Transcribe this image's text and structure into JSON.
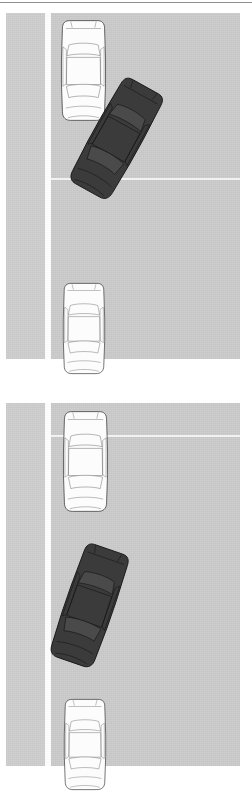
{
  "figure": {
    "width": 252,
    "height": 778,
    "background_color": "#ffffff",
    "top_rule_color": "#8f8f8f"
  },
  "palette": {
    "page_background": "#ffffff",
    "road_gray": "#cccccc",
    "shoulder_gray": "#cfcfcf",
    "lane_line_white": "#fbfbfb",
    "lane_line_faint": "#f2f2f2",
    "dark_car_body": "#3b3b3b",
    "dark_car_outline": "#141414",
    "dark_car_glass": "#4a4a4a",
    "light_car_body": "#fcfcfc",
    "light_car_outline": "#2b2b2b",
    "light_car_detail": "#6f6f6f"
  },
  "panels": [
    {
      "id": "panel-top",
      "label": "Top panel — dark car angled across the lane line",
      "rect": {
        "x": 0,
        "y": 13,
        "width": 240,
        "height": 346
      },
      "road": {
        "shoulder": {
          "x": 6,
          "y": 0,
          "width": 39,
          "height": 346
        },
        "lane_line_vertical": {
          "x": 45,
          "y": 0,
          "width": 6,
          "height": 346
        },
        "surface": {
          "x": 51,
          "y": 0,
          "width": 189,
          "height": 346
        },
        "lane_line_horizontal": {
          "x": 51,
          "y": 165,
          "width": 189,
          "height": 2
        }
      },
      "cars": [
        {
          "id": "top-light-car-upper",
          "name": "light-car-upper",
          "color": "light",
          "x": 59,
          "y": 5,
          "width": 49,
          "height": 105,
          "rotation_deg": 0,
          "description": "White sedan, overhead view, heading up the lane"
        },
        {
          "id": "top-dark-car",
          "name": "dark-car-merging",
          "color": "dark",
          "x": 90,
          "y": 63,
          "width": 53,
          "height": 125,
          "rotation_deg": 29,
          "description": "Dark sedan angled roughly 29 degrees, crossing into the lane"
        },
        {
          "id": "top-light-car-lower",
          "name": "light-car-lower",
          "color": "light",
          "x": 61,
          "y": 268,
          "width": 46,
          "height": 95,
          "rotation_deg": 0,
          "description": "White sedan partially cropped at the panel bottom"
        }
      ]
    },
    {
      "id": "panel-bottom",
      "label": "Bottom panel — dark car further along, more aligned with the lane",
      "rect": {
        "x": 0,
        "y": 403,
        "width": 240,
        "height": 363
      },
      "road": {
        "shoulder": {
          "x": 6,
          "y": 0,
          "width": 39,
          "height": 363
        },
        "lane_line_vertical": {
          "x": 45,
          "y": 0,
          "width": 6,
          "height": 363
        },
        "surface": {
          "x": 51,
          "y": 0,
          "width": 189,
          "height": 363
        },
        "lane_line_horizontal": {
          "x": 51,
          "y": 32,
          "width": 189,
          "height": 2
        }
      },
      "cars": [
        {
          "id": "bottom-light-car-upper",
          "name": "light-car-upper",
          "color": "light",
          "x": 61,
          "y": 6,
          "width": 49,
          "height": 105,
          "rotation_deg": 0,
          "description": "White sedan ahead in the lane"
        },
        {
          "id": "bottom-dark-car",
          "name": "dark-car-merging",
          "color": "dark",
          "x": 63,
          "y": 140,
          "width": 53,
          "height": 125,
          "rotation_deg": 19,
          "description": "Dark sedan angled roughly 19 degrees, settling into the lane"
        },
        {
          "id": "bottom-light-car-lower",
          "name": "light-car-lower",
          "color": "light",
          "x": 62,
          "y": 294,
          "width": 46,
          "height": 95,
          "rotation_deg": 0,
          "description": "White sedan partially cropped at the image bottom"
        }
      ]
    }
  ]
}
